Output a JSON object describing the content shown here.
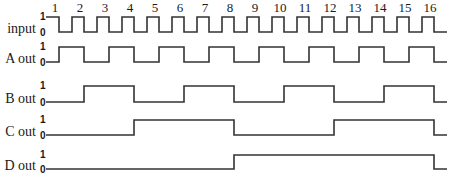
{
  "clock_numbers": [
    "1",
    "2",
    "3",
    "4",
    "5",
    "6",
    "7",
    "8",
    "9",
    "10",
    "11",
    "12",
    "13",
    "14",
    "15",
    "16"
  ],
  "level_labels": {
    "high": "1",
    "low": "0"
  },
  "signals": [
    {
      "name": "input",
      "label": "input",
      "high_y": 17,
      "low_y": 32,
      "start": 1,
      "kind": "clock"
    },
    {
      "name": "a-out",
      "label": "A out",
      "high_y": 47,
      "low_y": 62,
      "start": 0,
      "period_edges": 1
    },
    {
      "name": "b-out",
      "label": "B out",
      "high_y": 86,
      "low_y": 102,
      "start": 0,
      "period_edges": 2
    },
    {
      "name": "c-out",
      "label": "C out",
      "high_y": 120,
      "low_y": 135,
      "start": 0,
      "period_edges": 4
    },
    {
      "name": "d-out",
      "label": "D out",
      "high_y": 155,
      "low_y": 169,
      "start": 0,
      "period_edges": 8
    }
  ],
  "geometry": {
    "x_start": 46,
    "first_edge": 59,
    "edge_spacing": 25,
    "x_end": 447,
    "label_x": 36,
    "level_x": 40
  },
  "colors": {
    "line": "#333333",
    "text": "#1a1a1a",
    "background": "#ffffff"
  }
}
